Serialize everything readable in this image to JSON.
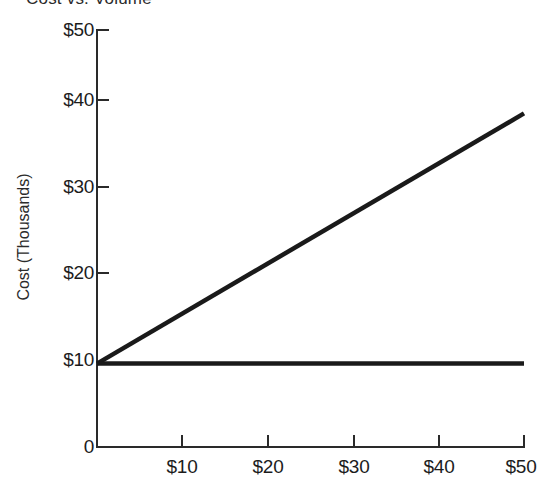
{
  "chart_data": {
    "type": "line",
    "title": "Cost vs. Volume",
    "xlabel": "",
    "ylabel": "Cost (Thousands)",
    "xlim": [
      0,
      50
    ],
    "ylim": [
      0,
      50
    ],
    "grid": false,
    "legend": "none",
    "x_tick_labels": [
      "$10",
      "$20",
      "$30",
      "$40",
      "$50"
    ],
    "x_tick_values": [
      10,
      20,
      30,
      40,
      50
    ],
    "y_tick_labels": [
      "$50",
      "$40",
      "$30",
      "$20",
      "$10",
      "0"
    ],
    "y_tick_values": [
      50,
      40,
      30,
      20,
      10,
      0
    ],
    "series": [
      {
        "name": "total-cost",
        "color": "#1a1a1a",
        "x": [
          0,
          50
        ],
        "values": [
          10,
          40
        ]
      },
      {
        "name": "fixed-cost",
        "color": "#1a1a1a",
        "x": [
          0,
          50
        ],
        "values": [
          10,
          10
        ]
      }
    ]
  },
  "axes": {
    "y_ticks": [
      {
        "label": "$50",
        "y": 30
      },
      {
        "label": "$40",
        "y": 100
      },
      {
        "label": "$30",
        "y": 187
      },
      {
        "label": "$20",
        "y": 273
      },
      {
        "label": "$10",
        "y": 360
      },
      {
        "label": "0",
        "y": 447
      }
    ],
    "x_ticks": [
      {
        "label": "$10",
        "x": 182
      },
      {
        "label": "$20",
        "x": 268
      },
      {
        "label": "$30",
        "x": 354
      },
      {
        "label": "$40",
        "x": 439
      },
      {
        "label": "$50",
        "x": 524
      }
    ]
  }
}
